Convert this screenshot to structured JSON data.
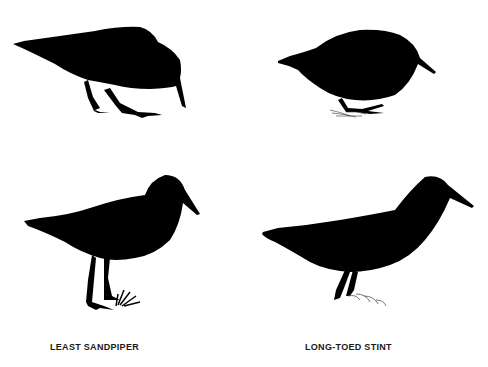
{
  "figure": {
    "background": "#ffffff",
    "silhouette_color": "#000000",
    "birds": [
      {
        "id": "top-left",
        "pose": "feeding, head down",
        "species_column": "left"
      },
      {
        "id": "top-right",
        "pose": "crouched feeding on grass",
        "species_column": "right"
      },
      {
        "id": "bottom-left",
        "pose": "standing on grass",
        "species_column": "left"
      },
      {
        "id": "bottom-right",
        "pose": "standing in shallow water",
        "species_column": "right"
      }
    ],
    "captions": {
      "left": "LEAST SANDPIPER",
      "right": "LONG-TOED STINT"
    }
  }
}
